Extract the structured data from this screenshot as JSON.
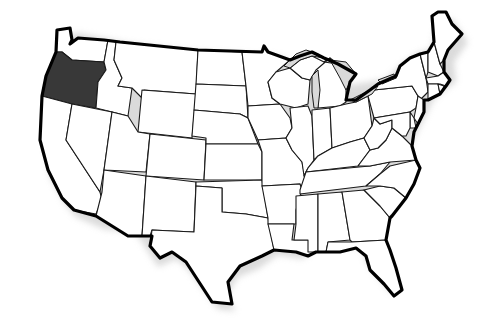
{
  "map": {
    "title": "",
    "region": "United States (contiguous 48 states)",
    "highlight_color": "#383838",
    "default_fill": "#ffffff",
    "lake_fill": "#d9d9d9",
    "border_color": "#1a1a1a",
    "highlighted_states": [
      "Oregon"
    ],
    "states": [
      {
        "id": "WA",
        "name": "Washington",
        "highlighted": false
      },
      {
        "id": "OR",
        "name": "Oregon",
        "highlighted": true
      },
      {
        "id": "CA",
        "name": "California",
        "highlighted": false
      },
      {
        "id": "ID",
        "name": "Idaho",
        "highlighted": false
      },
      {
        "id": "NV",
        "name": "Nevada",
        "highlighted": false
      },
      {
        "id": "MT",
        "name": "Montana",
        "highlighted": false
      },
      {
        "id": "WY",
        "name": "Wyoming",
        "highlighted": false
      },
      {
        "id": "UT",
        "name": "Utah",
        "highlighted": false
      },
      {
        "id": "AZ",
        "name": "Arizona",
        "highlighted": false
      },
      {
        "id": "CO",
        "name": "Colorado",
        "highlighted": false
      },
      {
        "id": "NM",
        "name": "New Mexico",
        "highlighted": false
      },
      {
        "id": "ND",
        "name": "North Dakota",
        "highlighted": false
      },
      {
        "id": "SD",
        "name": "South Dakota",
        "highlighted": false
      },
      {
        "id": "NE",
        "name": "Nebraska",
        "highlighted": false
      },
      {
        "id": "KS",
        "name": "Kansas",
        "highlighted": false
      },
      {
        "id": "OK",
        "name": "Oklahoma",
        "highlighted": false
      },
      {
        "id": "TX",
        "name": "Texas",
        "highlighted": false
      },
      {
        "id": "MN",
        "name": "Minnesota",
        "highlighted": false
      },
      {
        "id": "IA",
        "name": "Iowa",
        "highlighted": false
      },
      {
        "id": "MO",
        "name": "Missouri",
        "highlighted": false
      },
      {
        "id": "AR",
        "name": "Arkansas",
        "highlighted": false
      },
      {
        "id": "LA",
        "name": "Louisiana",
        "highlighted": false
      },
      {
        "id": "WI",
        "name": "Wisconsin",
        "highlighted": false
      },
      {
        "id": "IL",
        "name": "Illinois",
        "highlighted": false
      },
      {
        "id": "MI",
        "name": "Michigan",
        "highlighted": false
      },
      {
        "id": "IN",
        "name": "Indiana",
        "highlighted": false
      },
      {
        "id": "OH",
        "name": "Ohio",
        "highlighted": false
      },
      {
        "id": "KY",
        "name": "Kentucky",
        "highlighted": false
      },
      {
        "id": "TN",
        "name": "Tennessee",
        "highlighted": false
      },
      {
        "id": "MS",
        "name": "Mississippi",
        "highlighted": false
      },
      {
        "id": "AL",
        "name": "Alabama",
        "highlighted": false
      },
      {
        "id": "GA",
        "name": "Georgia",
        "highlighted": false
      },
      {
        "id": "FL",
        "name": "Florida",
        "highlighted": false
      },
      {
        "id": "SC",
        "name": "South Carolina",
        "highlighted": false
      },
      {
        "id": "NC",
        "name": "North Carolina",
        "highlighted": false
      },
      {
        "id": "VA",
        "name": "Virginia",
        "highlighted": false
      },
      {
        "id": "WV",
        "name": "West Virginia",
        "highlighted": false
      },
      {
        "id": "PA",
        "name": "Pennsylvania",
        "highlighted": false
      },
      {
        "id": "NY",
        "name": "New York",
        "highlighted": false
      },
      {
        "id": "VT",
        "name": "Vermont",
        "highlighted": false
      },
      {
        "id": "NH",
        "name": "New Hampshire",
        "highlighted": false
      },
      {
        "id": "ME",
        "name": "Maine",
        "highlighted": false
      },
      {
        "id": "MA",
        "name": "Massachusetts",
        "highlighted": false
      },
      {
        "id": "CT",
        "name": "Connecticut",
        "highlighted": false
      },
      {
        "id": "RI",
        "name": "Rhode Island",
        "highlighted": false
      },
      {
        "id": "NJ",
        "name": "New Jersey",
        "highlighted": false
      },
      {
        "id": "DE",
        "name": "Delaware",
        "highlighted": false
      },
      {
        "id": "MD",
        "name": "Maryland",
        "highlighted": false
      }
    ]
  }
}
